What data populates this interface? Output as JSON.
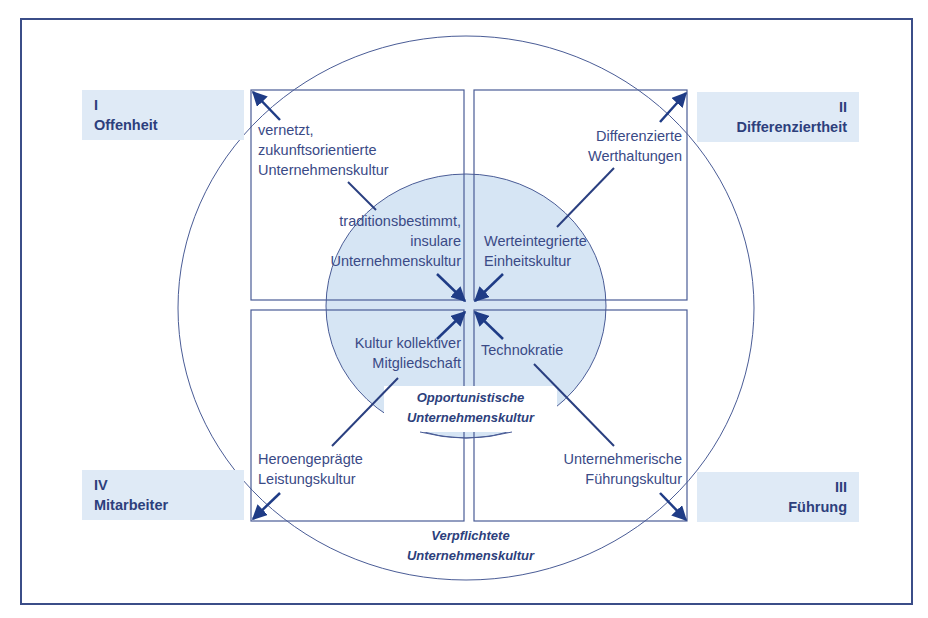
{
  "diagram": {
    "colors": {
      "frame": "#3b4d88",
      "line": "#4a5c96",
      "arrow": "#1f3c86",
      "corner_fill": "#dfeaf6",
      "inner_circle_fill": "#d6e5f4",
      "text": "#3a4a86",
      "heading_text": "#2d3f7c"
    },
    "corners": [
      {
        "numeral": "I",
        "label": "Offenheit",
        "position": "top-left"
      },
      {
        "numeral": "II",
        "label": "Differenziertheit",
        "position": "top-right"
      },
      {
        "numeral": "III",
        "label": "Führung",
        "position": "bottom-right"
      },
      {
        "numeral": "IV",
        "label": "Mitarbeiter",
        "position": "bottom-left"
      }
    ],
    "outer_cultures": [
      {
        "lines": [
          "vernetzt,",
          "zukunftsorientierte",
          "Unternehmenskultur"
        ],
        "quadrant": "I"
      },
      {
        "lines": [
          "Differenzierte",
          "Werthaltungen"
        ],
        "quadrant": "II"
      },
      {
        "lines": [
          "Unternehmerische",
          "Führungskultur"
        ],
        "quadrant": "III"
      },
      {
        "lines": [
          "Heroengeprägte",
          "Leistungskultur"
        ],
        "quadrant": "IV"
      }
    ],
    "inner_cultures": [
      {
        "lines": [
          "traditionsbestimmt,",
          "insulare",
          "Unternehmenskultur"
        ],
        "quadrant": "I"
      },
      {
        "lines": [
          "Werteintegrierte",
          "Einheitskultur"
        ],
        "quadrant": "II"
      },
      {
        "lines": [
          "Technokratie"
        ],
        "quadrant": "III"
      },
      {
        "lines": [
          "Kultur kollektiver",
          "Mitgliedschaft"
        ],
        "quadrant": "IV"
      }
    ],
    "inner_circle_label": [
      "Opportunistische",
      "Unternehmenskultur"
    ],
    "outer_circle_label": [
      "Verpflichtete",
      "Unternehmenskultur"
    ]
  }
}
